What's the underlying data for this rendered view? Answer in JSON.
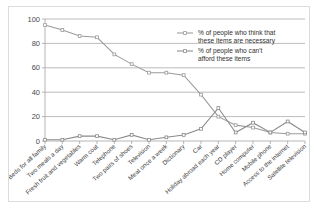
{
  "chart_data": {
    "type": "line",
    "title": "",
    "xlabel": "",
    "ylabel": "",
    "ylim": [
      0,
      100
    ],
    "yticks": [
      0,
      20,
      40,
      60,
      80,
      100
    ],
    "grid": true,
    "legend_position": "top-right",
    "categories": [
      "Beds for all family",
      "Two meals a day",
      "Fresh fruit and vegetables",
      "Warm coat",
      "Telephone",
      "Two pairs of shoes",
      "Television",
      "Meat once a week",
      "Dictionary",
      "Car",
      "Holiday abroad each year",
      "CD player",
      "Home computer",
      "Mobile phone",
      "Access to the internet",
      "Satellite television"
    ],
    "series": [
      {
        "name": "% of people who think that these items are necessary",
        "color": "#9a9a9a",
        "values": [
          95,
          91,
          86,
          85,
          71,
          63,
          56,
          56,
          54,
          38,
          20,
          13,
          11,
          7,
          6,
          6
        ]
      },
      {
        "name": "% of people who can't afford these items",
        "color": "#8a8a8a",
        "values": [
          1,
          1,
          4,
          4,
          1,
          5,
          1,
          3,
          5,
          10,
          27,
          7,
          15,
          7,
          16,
          7
        ]
      }
    ]
  },
  "legend": {
    "entries": [
      {
        "label_line1": "% of people who think that",
        "label_line2": "these items are necessary"
      },
      {
        "label_line1": "% of people who can't",
        "label_line2": "afford these items"
      }
    ]
  },
  "colors": {
    "series_necessary": "#9a9a9a",
    "series_cant_afford": "#8a8a8a",
    "grid": "#8f8f8f",
    "frame": "#dcdcdc",
    "background": "#ffffff"
  }
}
